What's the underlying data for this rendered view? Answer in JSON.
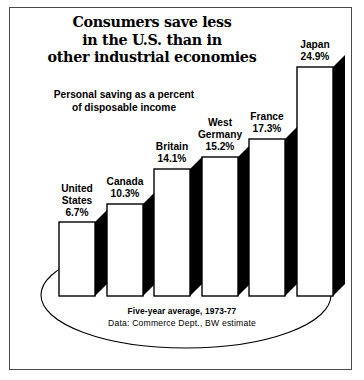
{
  "figure": {
    "title_lines": [
      "Consumers save less",
      "in the U.S. than in",
      "other industrial economies"
    ],
    "subtitle_lines": [
      "Personal saving as a percent",
      "of disposable income"
    ],
    "footer_note": "Five-year average, 1973-77",
    "footer_source": "Data: Commerce Dept., BW estimate",
    "colors": {
      "ink": "#000000",
      "frame": "#4a4a4a",
      "bar_fill": "#ffffff",
      "bar_stroke": "#000000",
      "shadow": "#000000",
      "background": "#ffffff"
    }
  },
  "chart_data": {
    "type": "bar",
    "title": "Consumers save less in the U.S. than in other industrial economies",
    "subtitle": "Personal saving as a percent of disposable income",
    "xlabel": "",
    "ylabel": "Personal saving as a percent of disposable income",
    "ylim": [
      0,
      24.9
    ],
    "grid": false,
    "legend": "none",
    "annotation": "Five-year average, 1973-77 | Data: Commerce Dept., BW estimate",
    "categories": [
      "United States",
      "Canada",
      "Britain",
      "West Germany",
      "France",
      "Japan"
    ],
    "values": [
      6.7,
      10.3,
      14.1,
      15.2,
      17.3,
      24.9
    ],
    "value_labels": [
      "6.7%",
      "10.3%",
      "14.1%",
      "15.2%",
      "17.3%",
      "24.9%"
    ]
  },
  "bars": [
    {
      "name_lines": [
        "United",
        "States"
      ],
      "value_label": "6.7%",
      "value": 6.7,
      "x": 59,
      "y": 222,
      "w": 36,
      "h": 74,
      "label_x": 47,
      "label_y": 183,
      "label_w": 60
    },
    {
      "name_lines": [
        "Canada"
      ],
      "value_label": "10.3%",
      "value": 10.3,
      "x": 107,
      "y": 204,
      "w": 36,
      "h": 92,
      "label_x": 93,
      "label_y": 176,
      "label_w": 64
    },
    {
      "name_lines": [
        "Britain"
      ],
      "value_label": "14.1%",
      "value": 14.1,
      "x": 154,
      "y": 169,
      "w": 36,
      "h": 127,
      "label_x": 140,
      "label_y": 141,
      "label_w": 64
    },
    {
      "name_lines": [
        "West",
        "Germany"
      ],
      "value_label": "15.2%",
      "value": 15.2,
      "x": 202,
      "y": 157,
      "w": 36,
      "h": 139,
      "label_x": 182,
      "label_y": 117,
      "label_w": 76
    },
    {
      "name_lines": [
        "France"
      ],
      "value_label": "17.3%",
      "value": 17.3,
      "x": 249,
      "y": 139,
      "w": 36,
      "h": 157,
      "label_x": 235,
      "label_y": 111,
      "label_w": 64
    },
    {
      "name_lines": [
        "Japan"
      ],
      "value_label": "24.9%",
      "value": 24.9,
      "x": 297,
      "y": 67,
      "w": 36,
      "h": 229,
      "label_x": 283,
      "label_y": 39,
      "label_w": 64
    }
  ]
}
